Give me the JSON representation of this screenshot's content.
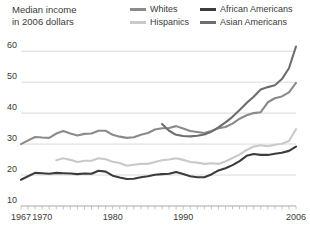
{
  "axis_title": "Median income\nin 2006 dollars",
  "legend": {
    "items": [
      {
        "label": "Whites",
        "color": "#8a8a8a",
        "row": 0,
        "col": 0
      },
      {
        "label": "African Americans",
        "color": "#3c3c3c",
        "row": 0,
        "col": 1
      },
      {
        "label": "Hispanics",
        "color": "#c9c9c9",
        "row": 1,
        "col": 0
      },
      {
        "label": "Asian Americans",
        "color": "#6e6e6e",
        "row": 1,
        "col": 1
      }
    ]
  },
  "chart_data": {
    "type": "line",
    "title": "",
    "subtitle": "",
    "xlabel": "",
    "ylabel": "Median income in 2006 dollars",
    "xlim": [
      1967,
      2006
    ],
    "ylim": [
      10,
      62
    ],
    "grid": true,
    "legend_position": "top-right",
    "ytick_labels": [
      "10",
      "20",
      "30",
      "40",
      "50",
      "60"
    ],
    "yticks": [
      10,
      20,
      30,
      40,
      50,
      60
    ],
    "xtick_labels": [
      "1967",
      "1970",
      "1980",
      "1990",
      "2006"
    ],
    "xticks_labeled": [
      1967,
      1970,
      1980,
      1990,
      2006
    ],
    "xticks_minor_step": 1,
    "units": "thousands of 2006 dollars",
    "series": [
      {
        "name": "Whites",
        "color": "#8a8a8a",
        "x": [
          1967,
          1968,
          1969,
          1970,
          1971,
          1972,
          1973,
          1974,
          1975,
          1976,
          1977,
          1978,
          1979,
          1980,
          1981,
          1982,
          1983,
          1984,
          1985,
          1986,
          1987,
          1988,
          1989,
          1990,
          1991,
          1992,
          1993,
          1994,
          1995,
          1996,
          1997,
          1998,
          1999,
          2000,
          2001,
          2002,
          2003,
          2004,
          2005,
          2006
        ],
        "values": [
          30.0,
          31.2,
          32.3,
          32.1,
          32.0,
          33.4,
          34.2,
          33.4,
          32.8,
          33.3,
          33.4,
          34.3,
          34.3,
          33.0,
          32.4,
          32.0,
          32.2,
          33.0,
          33.6,
          34.7,
          35.1,
          35.2,
          35.8,
          35.0,
          34.2,
          33.9,
          33.6,
          34.2,
          35.1,
          35.5,
          36.6,
          38.2,
          39.3,
          40.0,
          40.3,
          43.5,
          44.8,
          45.4,
          46.7,
          49.8
        ]
      },
      {
        "name": "African Americans",
        "color": "#3c3c3c",
        "x": [
          1967,
          1968,
          1969,
          1970,
          1971,
          1972,
          1973,
          1974,
          1975,
          1976,
          1977,
          1978,
          1979,
          1980,
          1981,
          1982,
          1983,
          1984,
          1985,
          1986,
          1987,
          1988,
          1989,
          1990,
          1991,
          1992,
          1993,
          1994,
          1995,
          1996,
          1997,
          1998,
          1999,
          2000,
          2001,
          2002,
          2003,
          2004,
          2005,
          2006
        ],
        "values": [
          18.5,
          19.6,
          20.7,
          20.6,
          20.4,
          20.7,
          20.6,
          20.5,
          20.3,
          20.5,
          20.4,
          21.4,
          21.1,
          19.8,
          19.2,
          18.7,
          18.8,
          19.3,
          19.6,
          20.1,
          20.3,
          20.4,
          21.0,
          20.3,
          19.6,
          19.3,
          19.3,
          20.2,
          21.5,
          22.2,
          23.2,
          24.5,
          26.2,
          26.8,
          26.5,
          26.5,
          26.9,
          27.2,
          27.8,
          29.2
        ]
      },
      {
        "name": "Hispanics",
        "color": "#c9c9c9",
        "x": [
          1972,
          1973,
          1974,
          1975,
          1976,
          1977,
          1978,
          1979,
          1980,
          1981,
          1982,
          1983,
          1984,
          1985,
          1986,
          1987,
          1988,
          1989,
          1990,
          1991,
          1992,
          1993,
          1994,
          1995,
          1996,
          1997,
          1998,
          1999,
          2000,
          2001,
          2002,
          2003,
          2004,
          2005,
          2006
        ],
        "values": [
          24.8,
          25.4,
          24.9,
          24.2,
          24.6,
          24.6,
          25.4,
          25.1,
          24.3,
          23.9,
          23.0,
          23.3,
          23.6,
          23.6,
          24.2,
          24.8,
          25.0,
          25.4,
          24.9,
          24.2,
          24.0,
          23.6,
          23.8,
          23.6,
          24.4,
          25.5,
          26.6,
          28.1,
          29.2,
          29.6,
          29.3,
          29.8,
          30.1,
          31.0,
          34.8
        ]
      },
      {
        "name": "Asian Americans",
        "color": "#6e6e6e",
        "x": [
          1987,
          1988,
          1989,
          1990,
          1991,
          1992,
          1993,
          1994,
          1995,
          1996,
          1997,
          1998,
          1999,
          2000,
          2001,
          2002,
          2003,
          2004,
          2005,
          2006
        ],
        "values": [
          36.5,
          34.3,
          33.0,
          32.6,
          32.5,
          32.7,
          33.1,
          34.0,
          35.4,
          37.0,
          38.8,
          41.0,
          43.3,
          45.3,
          47.6,
          48.4,
          49.0,
          51.0,
          54.5,
          61.5
        ]
      }
    ]
  }
}
